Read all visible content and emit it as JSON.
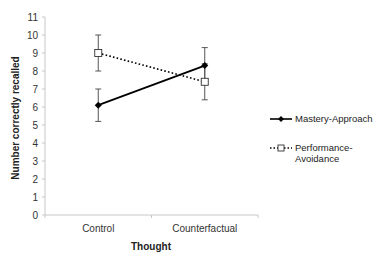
{
  "chart_data": {
    "type": "line",
    "title": "",
    "xlabel": "Thought",
    "ylabel": "Number correctly recalled",
    "categories": [
      "Control",
      "Counterfactual"
    ],
    "ylim": [
      0,
      11
    ],
    "yticks": [
      0,
      1,
      2,
      3,
      4,
      5,
      6,
      7,
      8,
      9,
      10,
      11
    ],
    "grid": false,
    "legend_position": "right",
    "series": [
      {
        "name": "Mastery-Approach",
        "values": [
          6.1,
          8.3
        ],
        "error": [
          0.9,
          1.0
        ],
        "line_style": "solid",
        "marker": "filled-diamond",
        "color": "#000000"
      },
      {
        "name": "Performance-Avoidance",
        "values": [
          9.0,
          7.4
        ],
        "error": [
          1.0,
          1.0
        ],
        "line_style": "dotted",
        "marker": "hollow-square",
        "color": "#000000"
      }
    ]
  },
  "legend": {
    "items": [
      {
        "line1": "Mastery-Approach",
        "line2": ""
      },
      {
        "line1": "Performance-",
        "line2": "Avoidance"
      }
    ]
  },
  "colors": {
    "axis": "#c8c8c8",
    "error_bar": "#555555",
    "series": "#000000"
  }
}
